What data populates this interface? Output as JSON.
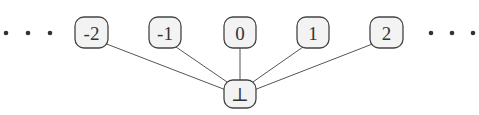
{
  "diagram": {
    "type": "lattice",
    "left_ellipsis": "...",
    "right_ellipsis": "...",
    "top_nodes": [
      {
        "id": "n-2",
        "label": "-2",
        "cx": 91,
        "cy": 33
      },
      {
        "id": "n-1",
        "label": "-1",
        "cx": 165,
        "cy": 33
      },
      {
        "id": "n0",
        "label": "0",
        "cx": 240,
        "cy": 33
      },
      {
        "id": "n1",
        "label": "1",
        "cx": 313,
        "cy": 33
      },
      {
        "id": "n2",
        "label": "2",
        "cx": 387,
        "cy": 33
      }
    ],
    "bottom_node": {
      "id": "bottom",
      "label": "⊥",
      "cx": 240,
      "cy": 94
    },
    "edges": [
      {
        "from": "bottom",
        "to": "n-2"
      },
      {
        "from": "bottom",
        "to": "n-1"
      },
      {
        "from": "bottom",
        "to": "n0"
      },
      {
        "from": "bottom",
        "to": "n1"
      },
      {
        "from": "bottom",
        "to": "n2"
      }
    ]
  }
}
